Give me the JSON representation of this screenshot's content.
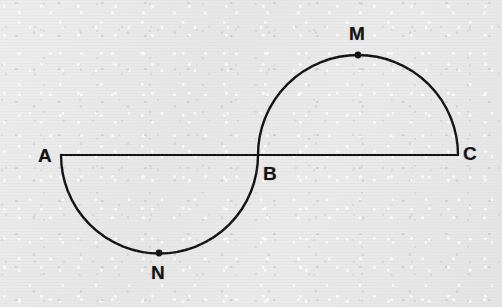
{
  "figure": {
    "width": 502,
    "height": 307,
    "background_color": "#e9e9e9",
    "ink_color": "#101010"
  },
  "geometry": {
    "baseline": {
      "label": "baseline-AC",
      "x1": 61,
      "y1": 155,
      "x2": 458,
      "y2": 155,
      "stroke_width": 2.1
    },
    "lower_arc": {
      "label": "arc-A-N-B",
      "from": "A",
      "to": "B",
      "through": "N",
      "center_x": 159.5,
      "center_y": 155,
      "radius": 98.5,
      "direction": "below-baseline",
      "stroke_width": 2.4
    },
    "upper_arc": {
      "label": "arc-B-M-C",
      "from": "B",
      "to": "C",
      "through": "M",
      "center_x": 358,
      "center_y": 155,
      "radius": 100,
      "direction": "above-baseline",
      "stroke_width": 2.4
    },
    "dot_radius": 3.4
  },
  "points": [
    {
      "id": "A",
      "label": "A",
      "x": 61,
      "y": 155,
      "label_x": 45,
      "label_y": 155,
      "marker": false
    },
    {
      "id": "B",
      "label": "B",
      "x": 258,
      "y": 155,
      "label_x": 270,
      "label_y": 173,
      "marker": false
    },
    {
      "id": "C",
      "label": "C",
      "x": 458,
      "y": 155,
      "label_x": 470,
      "label_y": 153,
      "marker": false
    },
    {
      "id": "M",
      "label": "M",
      "x": 358,
      "y": 55,
      "label_x": 357,
      "label_y": 33,
      "marker": true
    },
    {
      "id": "N",
      "label": "N",
      "x": 159,
      "y": 253,
      "label_x": 158,
      "label_y": 272,
      "marker": true
    }
  ]
}
